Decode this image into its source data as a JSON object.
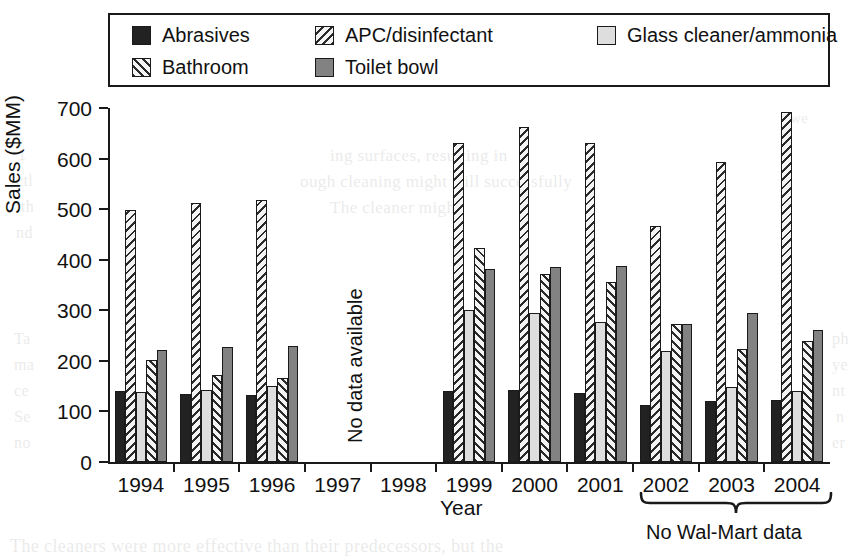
{
  "chart_data": {
    "type": "bar",
    "title": "",
    "xlabel": "Year",
    "ylabel": "Sales ($MM)",
    "ylim": [
      0,
      700
    ],
    "ytick_step": 100,
    "yticks": [
      0,
      100,
      200,
      300,
      400,
      500,
      600,
      700
    ],
    "grid": false,
    "legend_position": "top",
    "categories": [
      "1994",
      "1995",
      "1996",
      "1997",
      "1998",
      "1999",
      "2000",
      "2001",
      "2002",
      "2003",
      "2004"
    ],
    "series": [
      {
        "name": "Abrasives",
        "pattern": "solid-black",
        "color": "#222222",
        "values": [
          140,
          135,
          132,
          null,
          null,
          141,
          143,
          137,
          112,
          121,
          122
        ]
      },
      {
        "name": "APC/disinfectant",
        "pattern": "backslash-hatch",
        "color": "#f4f4f4",
        "values": [
          499,
          513,
          519,
          null,
          null,
          631,
          663,
          630,
          466,
          593,
          693
        ]
      },
      {
        "name": "Glass cleaner/ammonia",
        "pattern": "light-fill",
        "color": "#dedede",
        "values": [
          138,
          142,
          150,
          null,
          null,
          300,
          294,
          276,
          219,
          148,
          141
        ]
      },
      {
        "name": "Bathroom",
        "pattern": "forward-slash-hatch",
        "color": "#f4f4f4",
        "values": [
          201,
          173,
          166,
          null,
          null,
          423,
          371,
          355,
          272,
          224,
          240
        ]
      },
      {
        "name": "Toilet bowl",
        "pattern": "solid-gray",
        "color": "#828282",
        "values": [
          222,
          227,
          230,
          null,
          null,
          381,
          385,
          388,
          273,
          295,
          261
        ]
      }
    ],
    "annotations": [
      {
        "id": "no-data-available",
        "text": "No data available",
        "orientation": "vertical",
        "applies_to": [
          "1997",
          "1998"
        ]
      },
      {
        "id": "no-walmart-data",
        "text": "No Wal-Mart data",
        "orientation": "horizontal",
        "bracket": true,
        "applies_to": [
          "2002",
          "2003",
          "2004"
        ]
      }
    ]
  },
  "legend": {
    "entries": [
      {
        "label": "Abrasives",
        "pattern": "solid-black"
      },
      {
        "label": "APC/disinfectant",
        "pattern": "backslash-hatch"
      },
      {
        "label": "Glass cleaner/ammonia",
        "pattern": "light-fill"
      },
      {
        "label": "Bathroom",
        "pattern": "forward-slash-hatch"
      },
      {
        "label": "Toilet bowl",
        "pattern": "solid-gray"
      }
    ]
  },
  "axes": {
    "y_title": "Sales ($MM)",
    "x_title": "Year",
    "y_tick_labels": [
      "700",
      "600",
      "500",
      "400",
      "300",
      "200",
      "100",
      "0"
    ],
    "x_tick_labels": [
      "1994",
      "1995",
      "1996",
      "1997",
      "1998",
      "1999",
      "2000",
      "2001",
      "2002",
      "2003",
      "2004"
    ]
  },
  "annotations": {
    "no_data_available": "No data available",
    "no_walmart_data": "No Wal-Mart data"
  },
  "colors": {
    "ink": "#1a1a1a",
    "abrasives": "#222222",
    "toilet_bowl": "#828282",
    "glass_cleaner": "#dedede",
    "hatch_background": "#f4f4f4",
    "page_background": "#ffffff"
  },
  "page_bleed": {
    "lines": [
      {
        "text": "we",
        "x": 790,
        "y": 110,
        "size": 15
      },
      {
        "text": "ing surfaces, resulting in",
        "x": 330,
        "y": 146,
        "size": 17
      },
      {
        "text": "ough cleaning might still successfully",
        "x": 300,
        "y": 172,
        "size": 17
      },
      {
        "text": "The cleaner might",
        "x": 330,
        "y": 198,
        "size": 17
      },
      {
        "text": "1",
        "x": 18,
        "y": 146,
        "size": 16
      },
      {
        "text": "ctl",
        "x": 16,
        "y": 172,
        "size": 16
      },
      {
        "text": "ith",
        "x": 16,
        "y": 198,
        "size": 16
      },
      {
        "text": "nd",
        "x": 16,
        "y": 224,
        "size": 16
      },
      {
        "text": "Ta",
        "x": 14,
        "y": 330,
        "size": 16
      },
      {
        "text": "ma",
        "x": 14,
        "y": 356,
        "size": 16
      },
      {
        "text": "ce",
        "x": 14,
        "y": 382,
        "size": 16
      },
      {
        "text": "Se",
        "x": 14,
        "y": 408,
        "size": 16
      },
      {
        "text": "no",
        "x": 14,
        "y": 434,
        "size": 16
      },
      {
        "text": "ph",
        "x": 832,
        "y": 330,
        "size": 16
      },
      {
        "text": "ye",
        "x": 832,
        "y": 356,
        "size": 16
      },
      {
        "text": "nt",
        "x": 832,
        "y": 382,
        "size": 16
      },
      {
        "text": "n",
        "x": 836,
        "y": 408,
        "size": 16
      },
      {
        "text": "er",
        "x": 832,
        "y": 434,
        "size": 16
      },
      {
        "text": "The cleaners were more effective than their predecessors, but the",
        "x": 10,
        "y": 536,
        "size": 18
      }
    ]
  }
}
